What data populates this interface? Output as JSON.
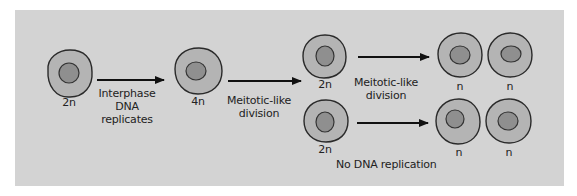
{
  "diagram": {
    "colors": {
      "background": "#ffffff",
      "panel": "#d3d3d3",
      "cytoplasm": "#b4b4b4",
      "nucleus": "#8f8f8f",
      "outline": "#2a2a2a",
      "arrow": "#111111",
      "text": "#222222"
    },
    "cells": [
      {
        "id": "parent",
        "label": "2n"
      },
      {
        "id": "replicated",
        "label": "4n"
      },
      {
        "id": "daughter-top",
        "label": "2n"
      },
      {
        "id": "daughter-bottom",
        "label": "2n"
      },
      {
        "id": "gamete-top-1",
        "label": "n"
      },
      {
        "id": "gamete-top-2",
        "label": "n"
      },
      {
        "id": "gamete-bottom-1",
        "label": "n"
      },
      {
        "id": "gamete-bottom-2",
        "label": "n"
      }
    ],
    "arrows": [
      {
        "id": "interphase",
        "label_lines": [
          "Interphase",
          "DNA",
          "replicates"
        ]
      },
      {
        "id": "division-1",
        "label_lines": [
          "Meitotic-like",
          "division"
        ]
      },
      {
        "id": "division-2-top",
        "label_lines": [
          "Meitotic-like",
          "division"
        ]
      },
      {
        "id": "division-2-bottom",
        "label_lines": [
          "No DNA replication"
        ]
      }
    ]
  }
}
